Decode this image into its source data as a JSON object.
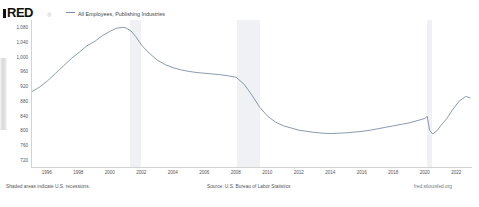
{
  "brand": {
    "logo_text": "RED",
    "logo_mark": "®",
    "url": "fred.stlouisfed.org"
  },
  "legend": {
    "series_label": "All Employees, Publishing Industries",
    "series_color": "#7a8fa6"
  },
  "footer": {
    "recession_note": "Shaded areas indicate U.S. recessions.",
    "source": "Source: U.S. Bureau of Labor Statistics"
  },
  "chart_data": {
    "type": "line",
    "title": "All Employees, Publishing Industries",
    "xlabel": "",
    "ylabel": "",
    "ylim": [
      700,
      1100
    ],
    "xlim": [
      1995.0,
      2023.0
    ],
    "grid": false,
    "legend_position": "top-left",
    "ytick_labels": [
      "1,080",
      "1,040",
      "1,000",
      "960",
      "920",
      "880",
      "840",
      "800",
      "760",
      "720"
    ],
    "ytick_values": [
      1080,
      1040,
      1000,
      960,
      920,
      880,
      840,
      800,
      760,
      720
    ],
    "xtick_labels": [
      "1996",
      "1998",
      "2000",
      "2002",
      "2004",
      "2006",
      "2008",
      "2010",
      "2012",
      "2014",
      "2016",
      "2018",
      "2020",
      "2022"
    ],
    "xtick_values": [
      1996,
      1998,
      2000,
      2002,
      2004,
      2006,
      2008,
      2010,
      2012,
      2014,
      2016,
      2018,
      2020,
      2022
    ],
    "units": "Thousands of Persons",
    "line_color": "#7a8fa6",
    "recessions": [
      {
        "start": 2001.25,
        "end": 2001.92
      },
      {
        "start": 2007.99,
        "end": 2009.5
      },
      {
        "start": 2020.08,
        "end": 2020.42
      }
    ],
    "series": [
      {
        "name": "All Employees, Publishing Industries",
        "x": [
          1995.0,
          1995.5,
          1996.0,
          1996.5,
          1997.0,
          1997.5,
          1998.0,
          1998.5,
          1999.0,
          1999.5,
          2000.0,
          2000.4,
          2000.8,
          2001.0,
          2001.3,
          2001.6,
          2002.0,
          2002.5,
          2003.0,
          2003.5,
          2004.0,
          2004.5,
          2005.0,
          2005.5,
          2006.0,
          2006.5,
          2007.0,
          2007.5,
          2008.0,
          2008.5,
          2009.0,
          2009.5,
          2010.0,
          2010.5,
          2011.0,
          2011.5,
          2012.0,
          2012.5,
          2013.0,
          2013.5,
          2014.0,
          2014.5,
          2015.0,
          2015.5,
          2016.0,
          2016.5,
          2017.0,
          2017.5,
          2018.0,
          2018.5,
          2019.0,
          2019.5,
          2020.0,
          2020.15,
          2020.3,
          2020.5,
          2020.8,
          2021.0,
          2021.4,
          2021.8,
          2022.2,
          2022.6,
          2022.9
        ],
        "y": [
          905,
          918,
          935,
          955,
          975,
          995,
          1012,
          1030,
          1042,
          1058,
          1070,
          1078,
          1080,
          1078,
          1070,
          1055,
          1030,
          1008,
          990,
          978,
          970,
          964,
          960,
          957,
          955,
          953,
          951,
          948,
          944,
          925,
          895,
          862,
          838,
          822,
          812,
          806,
          800,
          797,
          794,
          792,
          791,
          792,
          793,
          795,
          797,
          800,
          804,
          808,
          812,
          816,
          820,
          826,
          832,
          838,
          800,
          790,
          800,
          812,
          832,
          858,
          880,
          892,
          888
        ]
      }
    ]
  }
}
